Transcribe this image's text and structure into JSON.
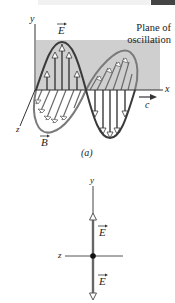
{
  "figure_a": {
    "plane_label_line1": "Plane of",
    "plane_label_line2": "oscillation",
    "axis_y": "y",
    "axis_x": "x",
    "axis_z": "z",
    "vector_E": "E",
    "vector_B": "B",
    "speed_label": "c",
    "caption": "(a)"
  },
  "figure_b": {
    "axis_y": "y",
    "axis_z": "z",
    "vector_E_upper": "E",
    "vector_E_lower": "E"
  },
  "colors": {
    "plane": "#cfcfcf",
    "e_wave": "#3a3a3a",
    "b_wave": "#7a7a7a",
    "field_line": "#555555"
  }
}
